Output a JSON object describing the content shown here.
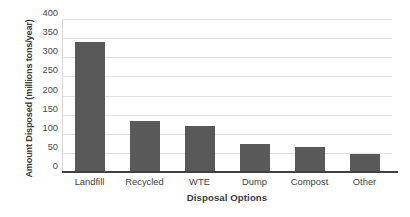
{
  "chart_data": {
    "type": "bar",
    "title": "",
    "xlabel": "Disposal Options",
    "ylabel": "Amount Disposed (millions tons/year)",
    "categories": [
      "Landfill",
      "Recycled",
      "WTE",
      "Dump",
      "Compost",
      "Other"
    ],
    "values": [
      340,
      133,
      120,
      72,
      66,
      46
    ],
    "series": [
      {
        "name": "Amount Disposed",
        "values": [
          340,
          133,
          120,
          72,
          66,
          46
        ]
      }
    ],
    "ylim": [
      0,
      400
    ],
    "ytick_labels": [
      "400",
      "350",
      "300",
      "250",
      "200",
      "150",
      "100",
      "50",
      "0"
    ],
    "ytick_values": [
      400,
      350,
      300,
      250,
      200,
      150,
      100,
      50,
      0
    ],
    "ytick_step": 50,
    "grid": "horizontal",
    "legend": "none",
    "bar_color": "#595959",
    "gridline_color": "#E2E2E2",
    "axis_color": "#404040",
    "background_color": "#FFFFFF",
    "annotations": []
  }
}
